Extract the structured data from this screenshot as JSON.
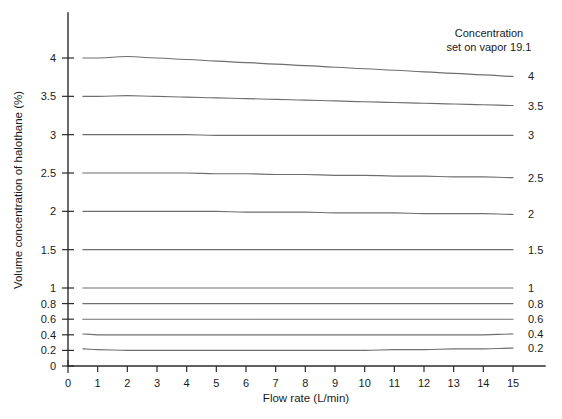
{
  "chart_data": {
    "type": "line",
    "title": "",
    "xlabel": "Flow rate (L/min)",
    "ylabel": "Volume concentration of halothane (%)",
    "xlim": [
      0,
      15
    ],
    "ylim": [
      0,
      4
    ],
    "grid": false,
    "legend_position": "right-of-curve-ends",
    "annotations": [
      {
        "name": "concentration-note",
        "line1": "Concentration",
        "line2": "set on vapor 19.1"
      }
    ],
    "x_ticks": [
      0,
      1,
      2,
      3,
      4,
      5,
      6,
      7,
      8,
      9,
      10,
      11,
      12,
      13,
      14,
      15
    ],
    "x_tick_labels": [
      "0",
      "1",
      "2",
      "3",
      "4",
      "5",
      "6",
      "7",
      "8",
      "9",
      "10",
      "11",
      "12",
      "13",
      "14",
      "15"
    ],
    "y_ticks": [
      0,
      0.2,
      0.4,
      0.6,
      0.8,
      1,
      1.5,
      2,
      2.5,
      3,
      3.5,
      4
    ],
    "y_tick_labels": [
      "0",
      "0.2",
      "0.4",
      "0.6",
      "0.8",
      "1",
      "1.5",
      "2",
      "2.5",
      "3",
      "3.5",
      "4"
    ],
    "y_axis_scale_note": "piecewise: 0-1 compressed, 1-4 expanded",
    "x": [
      0.5,
      1,
      2,
      3,
      4,
      5,
      6,
      7,
      8,
      9,
      10,
      11,
      12,
      13,
      14,
      15
    ],
    "series": [
      {
        "name": "4",
        "label": "4",
        "values": [
          4.0,
          4.0,
          4.02,
          4.0,
          3.98,
          3.96,
          3.94,
          3.92,
          3.9,
          3.88,
          3.86,
          3.84,
          3.82,
          3.8,
          3.78,
          3.76
        ]
      },
      {
        "name": "3.5",
        "label": "3.5",
        "values": [
          3.5,
          3.5,
          3.51,
          3.5,
          3.49,
          3.48,
          3.47,
          3.46,
          3.45,
          3.44,
          3.43,
          3.42,
          3.41,
          3.4,
          3.39,
          3.38
        ]
      },
      {
        "name": "3",
        "label": "3",
        "values": [
          3.0,
          3.0,
          3.0,
          3.0,
          3.0,
          2.99,
          2.99,
          2.99,
          2.99,
          2.99,
          2.99,
          2.99,
          2.99,
          2.99,
          2.99,
          2.99
        ]
      },
      {
        "name": "2.5",
        "label": "2.5",
        "values": [
          2.5,
          2.5,
          2.5,
          2.5,
          2.5,
          2.49,
          2.49,
          2.48,
          2.48,
          2.47,
          2.47,
          2.46,
          2.46,
          2.45,
          2.45,
          2.44
        ]
      },
      {
        "name": "2",
        "label": "2",
        "values": [
          2.0,
          2.0,
          2.0,
          2.0,
          2.0,
          2.0,
          1.99,
          1.99,
          1.99,
          1.98,
          1.98,
          1.98,
          1.97,
          1.97,
          1.97,
          1.96
        ]
      },
      {
        "name": "1.5",
        "label": "1.5",
        "values": [
          1.5,
          1.5,
          1.5,
          1.5,
          1.5,
          1.5,
          1.5,
          1.5,
          1.5,
          1.5,
          1.5,
          1.5,
          1.5,
          1.5,
          1.5,
          1.5
        ]
      },
      {
        "name": "1",
        "label": "1",
        "values": [
          1.0,
          1.0,
          1.0,
          1.0,
          1.0,
          1.0,
          1.0,
          1.0,
          1.0,
          1.0,
          1.0,
          1.0,
          1.0,
          1.0,
          1.0,
          1.0
        ]
      },
      {
        "name": "0.8",
        "label": "0.8",
        "values": [
          0.8,
          0.8,
          0.8,
          0.8,
          0.8,
          0.8,
          0.8,
          0.8,
          0.8,
          0.8,
          0.8,
          0.8,
          0.8,
          0.8,
          0.8,
          0.8
        ]
      },
      {
        "name": "0.6",
        "label": "0.6",
        "values": [
          0.6,
          0.6,
          0.6,
          0.6,
          0.6,
          0.6,
          0.6,
          0.6,
          0.6,
          0.6,
          0.6,
          0.6,
          0.6,
          0.6,
          0.6,
          0.6
        ]
      },
      {
        "name": "0.4",
        "label": "0.4",
        "values": [
          0.41,
          0.4,
          0.4,
          0.4,
          0.4,
          0.4,
          0.4,
          0.4,
          0.4,
          0.4,
          0.4,
          0.4,
          0.4,
          0.4,
          0.4,
          0.41
        ]
      },
      {
        "name": "0.2",
        "label": "0.2",
        "values": [
          0.22,
          0.21,
          0.2,
          0.2,
          0.2,
          0.2,
          0.2,
          0.2,
          0.2,
          0.2,
          0.2,
          0.21,
          0.21,
          0.22,
          0.22,
          0.23
        ]
      }
    ],
    "colors": {
      "curve": "#6f6f6f",
      "axis": "#2b2b2b",
      "text": "#1a1a1a",
      "background": "#ffffff"
    }
  }
}
